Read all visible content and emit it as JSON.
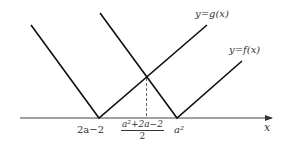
{
  "diagram": {
    "type": "piecewise-absolute-value-graphs",
    "colors": {
      "line": "#111111",
      "axis": "#333333",
      "dashed": "#555555",
      "text": "#333333",
      "background": "#ffffff"
    },
    "curves": [
      {
        "id": "g",
        "label": "y = g(x)",
        "vertex_label": "2a−2",
        "shape": "V"
      },
      {
        "id": "f",
        "label": "y = f(x)",
        "vertex_label": "a²",
        "shape": "V"
      }
    ],
    "x_axis": {
      "label": "x",
      "tick_labels": {
        "left_vertex": "2a−2",
        "midpoint_numerator": "a²+2a−2",
        "midpoint_denominator": "2",
        "right_vertex": "a²"
      }
    },
    "intersection": {
      "description": "g and f intersect above the midpoint",
      "dashed_drop_line": true
    }
  },
  "labels": {
    "g": "y=g(x)",
    "f": "y=f(x)",
    "x": "x",
    "left_vertex": "2a−2",
    "mid_num": "a²+2a−2",
    "mid_den": "2",
    "right_vertex": "a²"
  }
}
